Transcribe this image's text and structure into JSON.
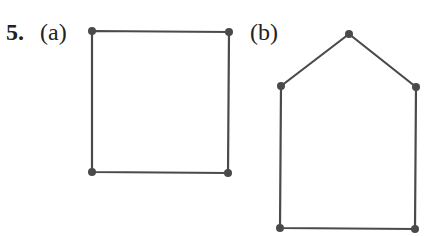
{
  "problem": {
    "number": "5.",
    "parts": [
      {
        "label": "(a)",
        "shape": "square",
        "vertices": [
          [
            92,
            31
          ],
          [
            229,
            32
          ],
          [
            228,
            173
          ],
          [
            92,
            172
          ]
        ]
      },
      {
        "label": "(b)",
        "shape": "pentagon-house",
        "vertices": [
          [
            349,
            34
          ],
          [
            416,
            87
          ],
          [
            415,
            229
          ],
          [
            280,
            228
          ],
          [
            281,
            86
          ]
        ]
      }
    ]
  },
  "style": {
    "stroke_color": "#4a4a4a",
    "vertex_color": "#4a4a4a",
    "text_color": "#222222",
    "background": "#ffffff"
  }
}
